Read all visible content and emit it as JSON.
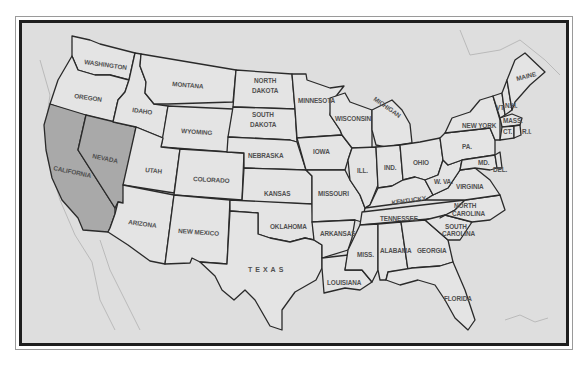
{
  "map": {
    "title": "",
    "highlight_color": "#a9a9a9",
    "state_fill": "#e4e4e4",
    "background_fill": "#dedede",
    "border_color": "#1e1e1e",
    "highlighted_states": [
      "CALIFORNIA",
      "NEVADA"
    ],
    "labels": {
      "washington": "WASHINGTON",
      "oregon": "OREGON",
      "california": "CALIFORNIA",
      "nevada": "NEVADA",
      "idaho": "IDAHO",
      "montana": "MONTANA",
      "wyoming": "WYOMING",
      "utah": "UTAH",
      "colorado": "COLORADO",
      "arizona": "ARIZONA",
      "new_mexico": "NEW MEXICO",
      "north_dakota_1": "NORTH",
      "north_dakota_2": "DAKOTA",
      "south_dakota_1": "SOUTH",
      "south_dakota_2": "DAKOTA",
      "nebraska": "NEBRASKA",
      "kansas": "KANSAS",
      "oklahoma": "OKLAHOMA",
      "texas": "TEXAS",
      "minnesota": "MINNESOTA",
      "iowa": "IOWA",
      "missouri": "MISSOURI",
      "arkansas": "ARKANSAS",
      "louisiana": "LOUISIANA",
      "wisconsin": "WISCONSIN",
      "michigan": "MICHIGAN",
      "illinois": "ILL.",
      "indiana": "IND.",
      "ohio": "OHIO",
      "kentucky": "KENTUCKY",
      "tennessee": "TENNESSEE",
      "mississippi": "MISS.",
      "alabama": "ALABAMA",
      "georgia": "GEORGIA",
      "florida": "FLORIDA",
      "south_carolina_1": "SOUTH",
      "south_carolina_2": "CAROLINA",
      "north_carolina_1": "NORTH",
      "north_carolina_2": "CAROLINA",
      "virginia": "VIRGINIA",
      "west_virginia": "W. VA.",
      "pennsylvania": "PA.",
      "new_york": "NEW YORK",
      "vermont": "VT.",
      "new_hampshire": "N.H.",
      "maine": "MAINE",
      "massachusetts": "MASS.",
      "connecticut": "CT.",
      "rhode_island": "R.I.",
      "maryland": "MD.",
      "delaware": "DEL."
    }
  }
}
